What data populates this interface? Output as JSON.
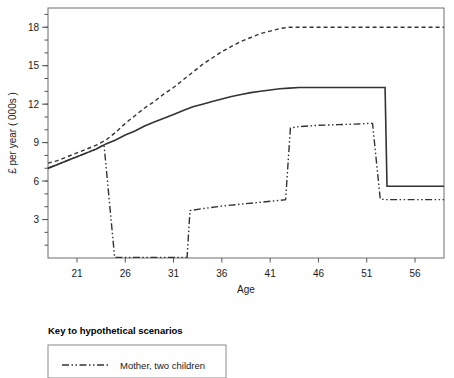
{
  "chart_data": {
    "type": "line",
    "title": "",
    "xlabel": "Age",
    "ylabel": "£ per year ( 000s )",
    "xlim": [
      18,
      59
    ],
    "ylim": [
      0,
      19.5
    ],
    "xticks": [
      21,
      26,
      31,
      36,
      41,
      46,
      51,
      56
    ],
    "yticks": [
      3,
      6,
      9,
      12,
      15,
      18
    ],
    "xtick_labels": [
      "21",
      "26",
      "31",
      "36",
      "41",
      "46",
      "51",
      "56"
    ],
    "ytick_labels": [
      "3",
      "6",
      "9",
      "12",
      "15",
      "18"
    ],
    "y_minor_tick_step": 1,
    "grid": false,
    "legend_position": "below-plot-left",
    "series": [
      {
        "name": "Childless woman",
        "style": "dashed",
        "color": "#333333",
        "x": [
          18,
          19,
          20,
          21,
          22,
          23,
          24,
          25,
          26,
          27,
          28,
          29,
          30,
          31,
          32,
          33,
          34,
          35,
          36,
          37,
          38,
          39,
          40,
          41,
          42,
          43,
          44,
          45,
          46,
          48,
          50,
          52,
          54,
          56,
          58,
          59
        ],
        "values": [
          7.4,
          7.6,
          7.9,
          8.2,
          8.5,
          8.8,
          9.2,
          9.8,
          10.5,
          11.1,
          11.7,
          12.2,
          12.8,
          13.3,
          13.9,
          14.5,
          15.1,
          15.6,
          16.1,
          16.5,
          16.9,
          17.2,
          17.5,
          17.7,
          17.9,
          18.0,
          18.0,
          18.0,
          18.0,
          18.0,
          18.0,
          18.0,
          18.0,
          18.0,
          18.0,
          18.0
        ]
      },
      {
        "name": "Mother, one child / solid scenario",
        "style": "solid",
        "color": "#333333",
        "x": [
          18,
          19,
          20,
          21,
          22,
          23,
          24,
          25,
          26,
          27,
          28,
          29,
          30,
          31,
          32,
          33,
          34,
          35,
          36,
          37,
          38,
          39,
          40,
          41,
          42,
          43,
          44,
          46,
          48,
          50,
          52,
          52.9,
          53.1,
          55,
          57,
          59
        ],
        "values": [
          7.0,
          7.3,
          7.6,
          7.9,
          8.2,
          8.5,
          8.9,
          9.2,
          9.6,
          9.9,
          10.3,
          10.6,
          10.9,
          11.2,
          11.5,
          11.8,
          12.0,
          12.2,
          12.4,
          12.6,
          12.75,
          12.9,
          13.0,
          13.1,
          13.2,
          13.25,
          13.3,
          13.3,
          13.3,
          13.3,
          13.3,
          13.3,
          5.6,
          5.6,
          5.6,
          5.6
        ]
      },
      {
        "name": "Mother, two children",
        "style": "dash-dot-dot",
        "color": "#333333",
        "x": [
          18,
          19,
          20,
          21,
          22,
          23,
          23.8,
          24.9,
          26,
          28,
          30,
          32,
          32.4,
          32.7,
          34,
          36,
          38,
          40,
          42,
          42.6,
          43.1,
          44,
          46,
          48,
          50,
          51.2,
          51.6,
          52.4,
          53,
          55,
          57,
          59
        ],
        "values": [
          7.0,
          7.3,
          7.6,
          7.9,
          8.2,
          8.5,
          8.85,
          0.05,
          0.05,
          0.05,
          0.05,
          0.05,
          0.05,
          3.7,
          3.85,
          4.05,
          4.2,
          4.35,
          4.5,
          4.55,
          10.15,
          10.25,
          10.35,
          10.4,
          10.45,
          10.5,
          10.5,
          4.6,
          4.55,
          4.55,
          4.55,
          4.55
        ]
      }
    ],
    "legend": {
      "title": "Key to hypothetical scenarios",
      "entries": [
        {
          "label": "Mother, two children",
          "style": "dash-dot-dot",
          "color": "#333333"
        }
      ]
    }
  }
}
